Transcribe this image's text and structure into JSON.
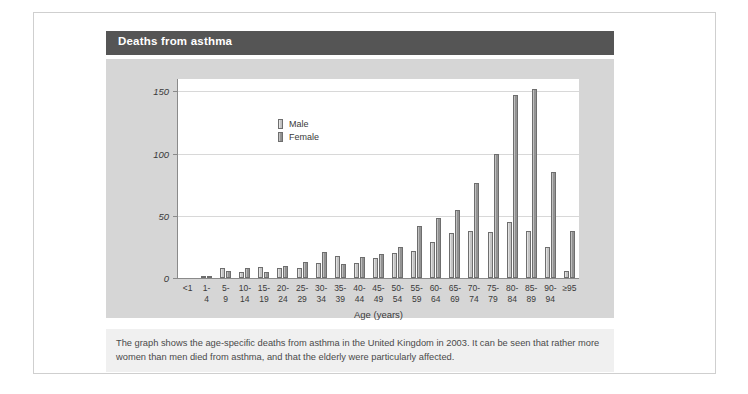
{
  "title": "Deaths from asthma",
  "caption": "The graph shows the age-specific deaths from asthma in the United Kingdom in 2003. It can be seen that rather more women than men died from asthma, and that the elderly were particularly affected.",
  "legend": {
    "male_label": "Male",
    "female_label": "Female"
  },
  "colors": {
    "title_bar": "#555555",
    "panel_background": "#d6d6d6",
    "plot_background": "#ffffff",
    "caption_background": "#f0f0f0",
    "male_bar": "#cfcfcf",
    "female_bar": "#8f8f8f",
    "axis": "#8a8a8a",
    "gridline": "#d8d8d8"
  },
  "chart_data": {
    "type": "bar",
    "title": "Deaths from asthma",
    "xlabel": "Age (years)",
    "ylabel": "",
    "ylim": [
      0,
      160
    ],
    "yticks": [
      0,
      50,
      100,
      150
    ],
    "grid": true,
    "legend_position": "top-left",
    "categories": [
      "<1",
      "1-4",
      "5-9",
      "10-14",
      "15-19",
      "20-24",
      "25-29",
      "30-34",
      "35-39",
      "40-44",
      "45-49",
      "50-54",
      "55-59",
      "60-64",
      "65-69",
      "70-74",
      "75-79",
      "80-84",
      "85-89",
      "90-94",
      "≥95"
    ],
    "category_lines": [
      [
        "<1",
        ""
      ],
      [
        "1-",
        "4"
      ],
      [
        "5-",
        "9"
      ],
      [
        "10-",
        "14"
      ],
      [
        "15-",
        "19"
      ],
      [
        "20-",
        "24"
      ],
      [
        "25-",
        "29"
      ],
      [
        "30-",
        "34"
      ],
      [
        "35-",
        "39"
      ],
      [
        "40-",
        "44"
      ],
      [
        "45-",
        "49"
      ],
      [
        "50-",
        "54"
      ],
      [
        "55-",
        "59"
      ],
      [
        "60-",
        "64"
      ],
      [
        "65-",
        "69"
      ],
      [
        "70-",
        "74"
      ],
      [
        "75-",
        "79"
      ],
      [
        "80-",
        "84"
      ],
      [
        "85-",
        "89"
      ],
      [
        "90-",
        "94"
      ],
      [
        "≥95",
        ""
      ]
    ],
    "series": [
      {
        "name": "Male",
        "values": [
          0,
          1,
          8,
          5,
          9,
          8,
          8,
          12,
          18,
          12,
          16,
          20,
          22,
          29,
          36,
          38,
          37,
          45,
          38,
          25,
          6
        ]
      },
      {
        "name": "Female",
        "values": [
          0,
          2,
          6,
          8,
          5,
          10,
          13,
          21,
          11,
          17,
          19,
          25,
          42,
          48,
          55,
          76,
          100,
          147,
          152,
          85,
          38
        ]
      }
    ]
  }
}
